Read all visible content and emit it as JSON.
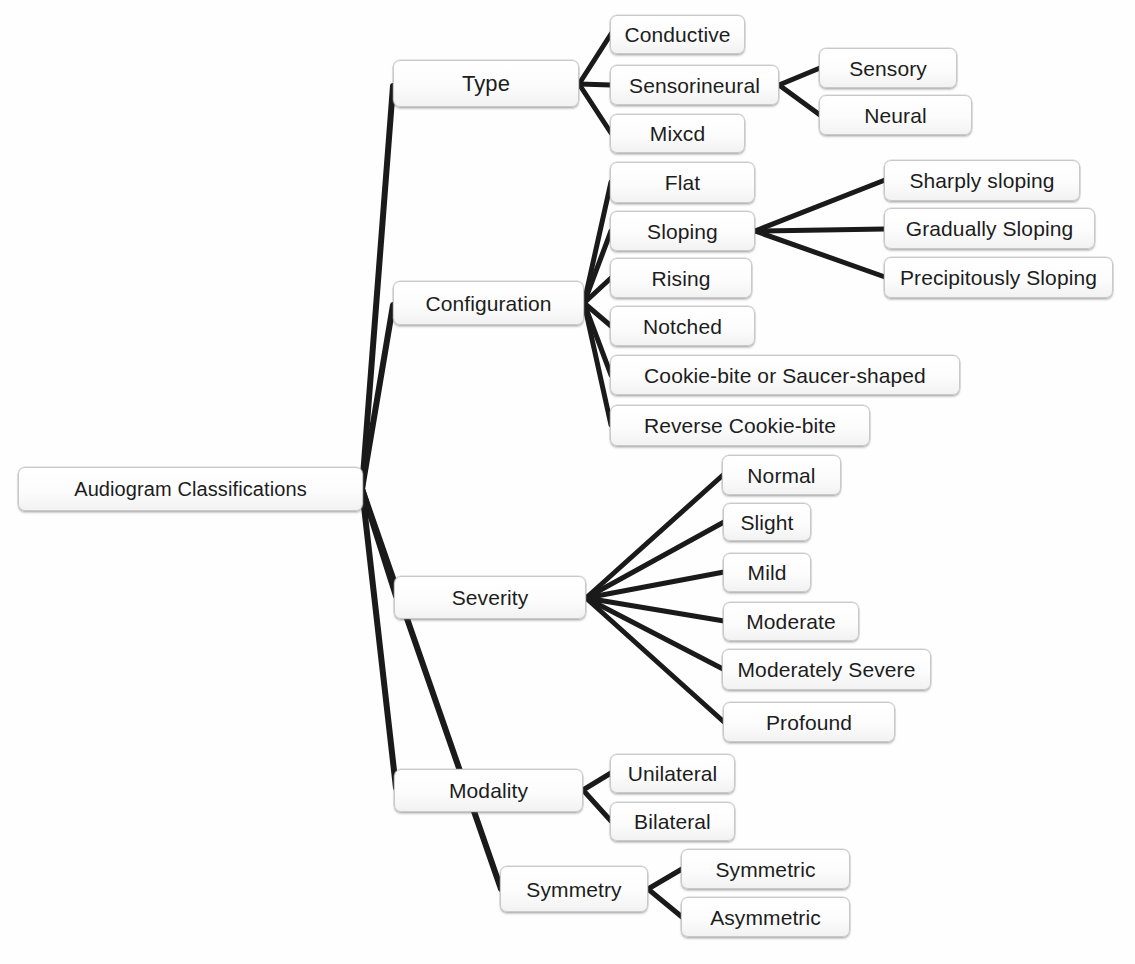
{
  "diagram": {
    "title": "Audiogram Classifications",
    "type": "tree-mind-map",
    "root": {
      "id": "root",
      "label": "Audiogram Classifications"
    },
    "nodes": {
      "type": "Type",
      "configuration": "Configuration",
      "severity": "Severity",
      "modality": "Modality",
      "symmetry": "Symmetry",
      "conductive": "Conductive",
      "sensorineural": "Sensorineural",
      "mixed": "Mixcd",
      "sensory": "Sensory",
      "neural": "Neural",
      "flat": "Flat",
      "sloping": "Sloping",
      "rising": "Rising",
      "notched": "Notched",
      "cookie_bite": "Cookie-bite or Saucer-shaped",
      "reverse_cookie_bite": "Reverse Cookie-bite",
      "sharply_sloping": "Sharply sloping",
      "gradually_sloping": "Gradually Sloping",
      "precipitously_sloping": "Precipitously Sloping",
      "normal": "Normal",
      "slight": "Slight",
      "mild": "Mild",
      "moderate": "Moderate",
      "moderately_severe": "Moderately Severe",
      "profound": "Profound",
      "unilateral": "Unilateral",
      "bilateral": "Bilateral",
      "symmetric": "Symmetric",
      "asymmetric": "Asymmetric"
    },
    "branches": [
      {
        "label": "Type",
        "children": [
          "Conductive",
          "Sensorineural",
          "Mixcd"
        ],
        "grandchildren": {
          "Sensorineural": [
            "Sensory",
            "Neural"
          ]
        }
      },
      {
        "label": "Configuration",
        "children": [
          "Flat",
          "Sloping",
          "Rising",
          "Notched",
          "Cookie-bite or Saucer-shaped",
          "Reverse Cookie-bite"
        ],
        "grandchildren": {
          "Sloping": [
            "Sharply sloping",
            "Gradually Sloping",
            "Precipitously Sloping"
          ]
        }
      },
      {
        "label": "Severity",
        "children": [
          "Normal",
          "Slight",
          "Mild",
          "Moderate",
          "Moderately Severe",
          "Profound"
        ],
        "grandchildren": {}
      },
      {
        "label": "Modality",
        "children": [
          "Unilateral",
          "Bilateral"
        ],
        "grandchildren": {}
      },
      {
        "label": "Symmetry",
        "children": [
          "Symmetric",
          "Asymmetric"
        ],
        "grandchildren": {}
      }
    ],
    "colors": {
      "background": "#ffffff",
      "node_fill": "#fcfcfc",
      "node_border": "#c9c9c9",
      "edge": "#1a1a1a",
      "text": "#1d1d1d"
    }
  }
}
